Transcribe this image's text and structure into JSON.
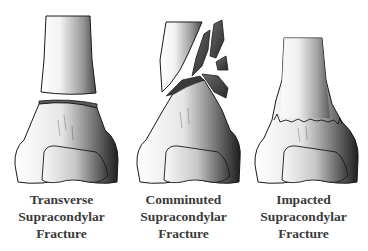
{
  "figure": {
    "background": "#ffffff",
    "panels": [
      {
        "id": "transverse",
        "caption": [
          "Transverse",
          "Supracondylar",
          "Fracture"
        ]
      },
      {
        "id": "comminuted",
        "caption": [
          "Comminuted",
          "Supracondylar",
          "Fracture"
        ]
      },
      {
        "id": "impacted",
        "caption": [
          "Impacted",
          "Supracondylar",
          "Fracture"
        ]
      }
    ],
    "colors": {
      "outline": "#1a1a1a",
      "shadow": "#2e2e2e",
      "light": "#f4f4f4",
      "text": "#3a3a3a"
    }
  }
}
